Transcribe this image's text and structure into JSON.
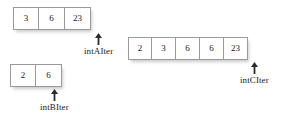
{
  "diagram": {
    "background_color": "#ffffff",
    "cell_border_color": "#9a9a9a",
    "text_color": "#1a1a1a",
    "arrays": [
      {
        "id": "a",
        "name": "array-a",
        "values": [
          "3",
          "6",
          "23"
        ],
        "pointer": {
          "label": "intAIter",
          "icon": "up-arrow-icon",
          "points_to_index_after_last": true
        }
      },
      {
        "id": "b",
        "name": "array-b",
        "values": [
          "2",
          "6"
        ],
        "pointer": {
          "label": "intBIter",
          "icon": "up-arrow-icon",
          "points_to_index_after_last": true
        }
      },
      {
        "id": "c",
        "name": "array-c",
        "values": [
          "2",
          "3",
          "6",
          "6",
          "23"
        ],
        "pointer": {
          "label": "intCIter",
          "icon": "up-arrow-icon",
          "points_to_index_after_last": true
        }
      }
    ]
  }
}
